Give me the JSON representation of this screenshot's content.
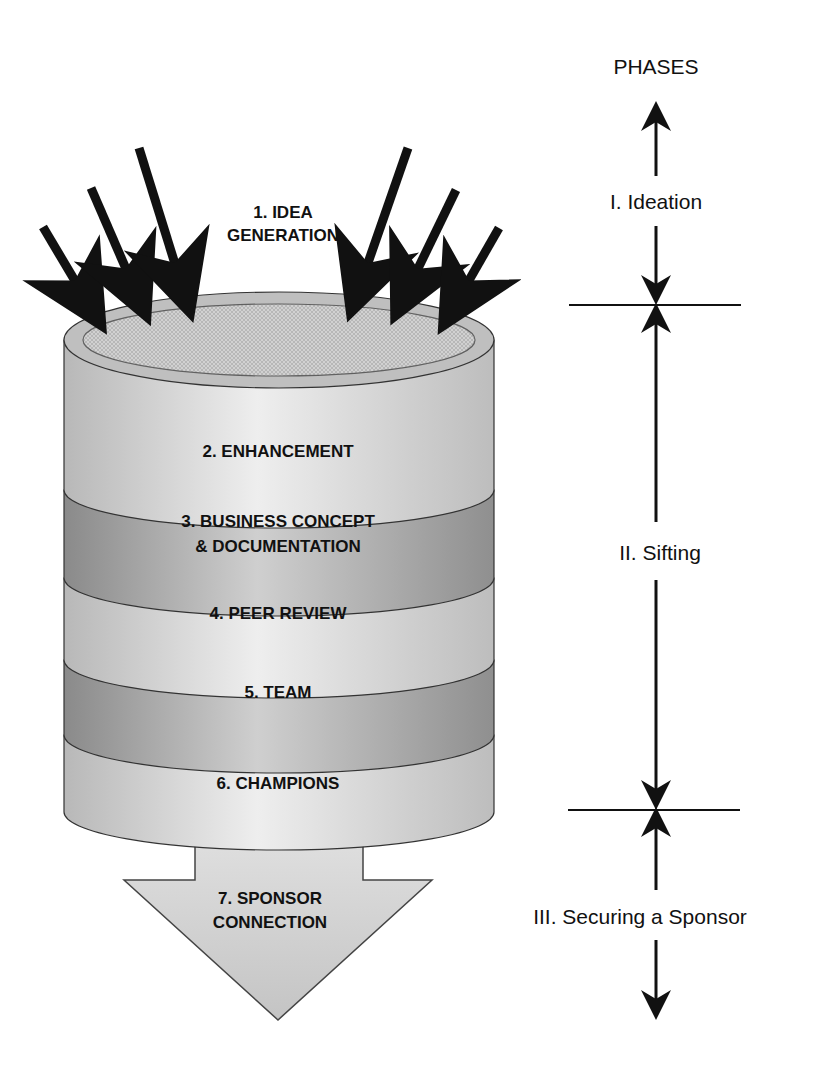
{
  "diagram": {
    "type": "process-funnel",
    "phases_header": "PHASES",
    "inputs": {
      "arrow_count": 6,
      "label_line1": "1. IDEA",
      "label_line2": "GENERATION"
    },
    "stages": [
      {
        "label": "2. ENHANCEMENT"
      },
      {
        "label_line1": "3. BUSINESS CONCEPT",
        "label_line2": "& DOCUMENTATION"
      },
      {
        "label": "4. PEER REVIEW"
      },
      {
        "label": "5. TEAM"
      },
      {
        "label": "6. CHAMPIONS"
      }
    ],
    "output": {
      "label_line1": "7. SPONSOR",
      "label_line2": "CONNECTION"
    },
    "phases": [
      {
        "label": "I. Ideation"
      },
      {
        "label": "II. Sifting"
      },
      {
        "label": "III. Securing a Sponsor"
      }
    ],
    "colors": {
      "light_band": "#dcdcdc",
      "dark_band": "#a8a8a8",
      "outline": "#333333",
      "arrow": "#111111"
    }
  }
}
